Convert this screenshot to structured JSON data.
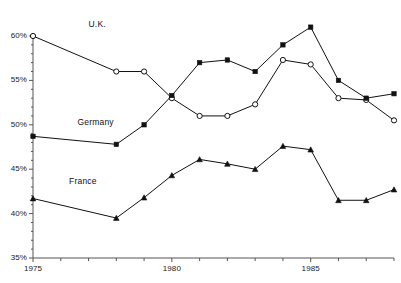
{
  "chart_data": {
    "type": "line",
    "title": "",
    "subtitle": "",
    "xlabel": "",
    "ylabel": "",
    "x": [
      1975,
      1978,
      1979,
      1980,
      1981,
      1982,
      1983,
      1984,
      1985,
      1986,
      1987,
      1988
    ],
    "xlim": [
      1975,
      1988
    ],
    "ylim": [
      35,
      60
    ],
    "grid": false,
    "legend_position": "inline-annotations",
    "x_tick_values": [
      1975,
      1976,
      1977,
      1978,
      1979,
      1980,
      1981,
      1982,
      1983,
      1984,
      1985,
      1986,
      1987,
      1988
    ],
    "x_tick_labels": [
      "1975",
      "",
      "",
      "",
      "",
      "1980",
      "",
      "",
      "",
      "",
      "1985",
      "",
      "",
      ""
    ],
    "y_tick_values": [
      35,
      40,
      45,
      50,
      55,
      60
    ],
    "y_tick_labels": [
      "35%",
      "40%",
      "45%",
      "50%",
      "55%",
      "60%"
    ],
    "y_minor_step": 1,
    "series": [
      {
        "name": "U.K.",
        "marker": "open-circle",
        "values": [
          60.0,
          56.0,
          56.0,
          53.0,
          51.0,
          51.0,
          52.3,
          57.3,
          56.8,
          53.0,
          52.8,
          50.5
        ]
      },
      {
        "name": "Germany",
        "marker": "filled-square",
        "values": [
          48.7,
          47.8,
          50.0,
          53.3,
          57.0,
          57.3,
          56.0,
          59.0,
          61.0,
          55.0,
          53.0,
          53.5
        ]
      },
      {
        "name": "France",
        "marker": "filled-triangle",
        "values": [
          41.7,
          39.5,
          41.8,
          44.3,
          46.1,
          45.6,
          45.0,
          47.6,
          47.2,
          41.5,
          41.5,
          42.7
        ]
      }
    ],
    "annotations": [
      {
        "text": "U.K.",
        "x": 1977.0,
        "y": 61.2
      },
      {
        "text": "Germany",
        "x": 1976.6,
        "y": 50.2
      },
      {
        "text": "France",
        "x": 1976.3,
        "y": 43.6
      }
    ],
    "colors": {
      "line": "#111111",
      "axis": "#555555",
      "text": "#1a1a1a",
      "marker_fill_open": "#ffffff",
      "marker_fill_solid": "#111111",
      "background": "#ffffff"
    }
  }
}
